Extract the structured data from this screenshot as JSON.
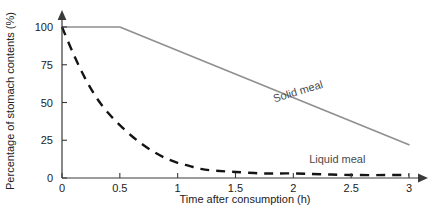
{
  "chart_data": {
    "type": "line",
    "title": "",
    "subtitle": "",
    "xlabel": "Time after consumption (h)",
    "ylabel": "Percentage of stomach contents (%)",
    "xlim": [
      0,
      3
    ],
    "ylim": [
      0,
      100
    ],
    "xticks": [
      "0",
      "0.5",
      "1",
      "1.5",
      "2",
      "2.5",
      "3"
    ],
    "xtick_values": [
      0,
      0.5,
      1,
      1.5,
      2,
      2.5,
      3
    ],
    "yticks": [
      "0",
      "25",
      "50",
      "75",
      "100"
    ],
    "ytick_values": [
      0,
      25,
      50,
      75,
      100
    ],
    "grid": "off",
    "legend_position": "inline-labels",
    "axis_style": "arrow-ended",
    "series": [
      {
        "name": "Solid meal",
        "style": "solid",
        "color": "#8f8f8f",
        "x": [
          0,
          0.5,
          3
        ],
        "values": [
          100,
          100,
          22
        ]
      },
      {
        "name": "Liquid meal",
        "style": "dashed",
        "color": "#141414",
        "x": [
          0,
          0.1,
          0.2,
          0.3,
          0.4,
          0.5,
          0.6,
          0.7,
          0.8,
          0.9,
          1,
          1.1,
          1.2,
          1.3,
          1.5,
          1.75,
          2,
          2.5,
          3
        ],
        "values": [
          100,
          82,
          66,
          53,
          43,
          35,
          28,
          22,
          17,
          13,
          10,
          8,
          6,
          5,
          4,
          3,
          3,
          2,
          2
        ]
      }
    ],
    "annotations": [
      {
        "text": "Solid meal",
        "x": 2.05,
        "y": 55,
        "rotation": -17
      },
      {
        "text": "Liquid meal",
        "x": 2.38,
        "y": 10,
        "rotation": 0
      }
    ]
  },
  "axis": {
    "x_title": "Time after consumption (h)",
    "y_title": "Percentage of stomach contents (%)"
  }
}
